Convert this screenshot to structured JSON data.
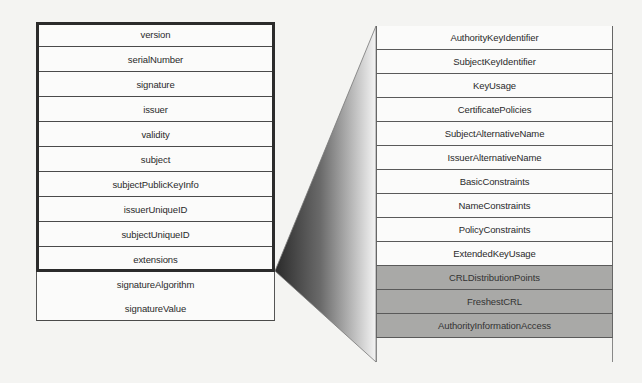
{
  "diagram": {
    "type": "X.509 certificate structure with extensions expansion",
    "left_table": {
      "rows": [
        {
          "label": "version",
          "in_tbs_frame": true
        },
        {
          "label": "serialNumber",
          "in_tbs_frame": true
        },
        {
          "label": "signature",
          "in_tbs_frame": true
        },
        {
          "label": "issuer",
          "in_tbs_frame": true
        },
        {
          "label": "validity",
          "in_tbs_frame": true
        },
        {
          "label": "subject",
          "in_tbs_frame": true
        },
        {
          "label": "subjectPublicKeyInfo",
          "in_tbs_frame": true
        },
        {
          "label": "issuerUniqueID",
          "in_tbs_frame": true
        },
        {
          "label": "subjectUniqueID",
          "in_tbs_frame": true
        },
        {
          "label": "extensions",
          "in_tbs_frame": true
        },
        {
          "label": "signatureAlgorithm",
          "in_tbs_frame": false
        },
        {
          "label": "signatureValue",
          "in_tbs_frame": false
        }
      ]
    },
    "connector": {
      "from": "extensions",
      "to": "right_table",
      "style": "gradient wedge dark-to-light"
    },
    "right_table": {
      "rows": [
        {
          "label": "AuthorityKeyIdentifier",
          "shaded": false
        },
        {
          "label": "SubjectKeyIdentifier",
          "shaded": false
        },
        {
          "label": "KeyUsage",
          "shaded": false
        },
        {
          "label": "CertificatePolicies",
          "shaded": false
        },
        {
          "label": "SubjectAlternativeName",
          "shaded": false
        },
        {
          "label": "IssuerAlternativeName",
          "shaded": false
        },
        {
          "label": "BasicConstraints",
          "shaded": false
        },
        {
          "label": "NameConstraints",
          "shaded": false
        },
        {
          "label": "PolicyConstraints",
          "shaded": false
        },
        {
          "label": "ExtendedKeyUsage",
          "shaded": false
        },
        {
          "label": "CRLDistributionPoints",
          "shaded": true
        },
        {
          "label": "FreshestCRL",
          "shaded": true
        },
        {
          "label": "AuthorityInformationAccess",
          "shaded": true
        }
      ]
    },
    "colors": {
      "background": "#f4f4f2",
      "cell_fill": "#fbfbfa",
      "shaded_fill": "#a9a9a7",
      "frame": "#2b2b2b",
      "wedge_dark": "#2e2e2e",
      "wedge_light": "#f2f2f2"
    }
  }
}
